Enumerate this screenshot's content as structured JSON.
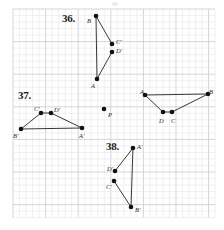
{
  "page": {
    "width": 224,
    "height": 230,
    "background": "#ffffff"
  },
  "grid": {
    "origin_x": 13,
    "origin_y": 9,
    "cell": 6.52,
    "cells_x": 31,
    "cells_y": 32,
    "minor_color": "#e3e3e6",
    "major_color": "#cdced2",
    "major_every": 5
  },
  "problems": [
    {
      "id": "36",
      "label": "36.",
      "x": 62,
      "y": 12
    },
    {
      "id": "37",
      "label": "37.",
      "x": 18,
      "y": 89
    },
    {
      "id": "38",
      "label": "38.",
      "x": 106,
      "y": 140
    }
  ],
  "figures": [
    {
      "name": "figure-36",
      "problem": "36",
      "points": [
        {
          "label": "B",
          "x": 96,
          "y": 16,
          "lx": 87,
          "ly": 18
        },
        {
          "label": "C'",
          "x": 112,
          "y": 44,
          "lx": 116,
          "ly": 39
        },
        {
          "label": "D'",
          "x": 112,
          "y": 52,
          "lx": 116,
          "ly": 48
        },
        {
          "label": "A",
          "x": 97,
          "y": 79,
          "lx": 91,
          "ly": 83
        }
      ],
      "segments": [
        {
          "from": "B",
          "to": "A"
        },
        {
          "from": "B",
          "to": "C'"
        },
        {
          "from": "D'",
          "to": "A"
        }
      ]
    },
    {
      "name": "figure-37",
      "problem": "37",
      "points": [
        {
          "label": "C'",
          "x": 41,
          "y": 113,
          "lx": 34,
          "ly": 106
        },
        {
          "label": "D'",
          "x": 51,
          "y": 113,
          "lx": 54,
          "ly": 107
        },
        {
          "label": "B'",
          "x": 21,
          "y": 129,
          "lx": 13,
          "ly": 133
        },
        {
          "label": "A'",
          "x": 82,
          "y": 128,
          "lx": 79,
          "ly": 133
        }
      ],
      "segments": [
        {
          "from": "C'",
          "to": "B'"
        },
        {
          "from": "D'",
          "to": "A'"
        },
        {
          "from": "B'",
          "to": "A'"
        },
        {
          "from": "C'",
          "to": "D'"
        }
      ]
    },
    {
      "name": "figure-original-abcd",
      "problem": "",
      "points": [
        {
          "label": "A",
          "x": 145,
          "y": 95,
          "lx": 140,
          "ly": 89
        },
        {
          "label": "B",
          "x": 208,
          "y": 94,
          "lx": 209,
          "ly": 89
        },
        {
          "label": "D",
          "x": 163,
          "y": 112,
          "lx": 159,
          "ly": 118
        },
        {
          "label": "C",
          "x": 172,
          "y": 112,
          "lx": 171,
          "ly": 118
        }
      ],
      "segments": [
        {
          "from": "A",
          "to": "B"
        },
        {
          "from": "A",
          "to": "D"
        },
        {
          "from": "D",
          "to": "C"
        },
        {
          "from": "C",
          "to": "B"
        }
      ]
    },
    {
      "name": "figure-38",
      "problem": "38",
      "points": [
        {
          "label": "A'",
          "x": 133,
          "y": 148,
          "lx": 137,
          "ly": 144
        },
        {
          "label": "D'",
          "x": 115,
          "y": 171,
          "lx": 107,
          "ly": 166
        },
        {
          "label": "C'",
          "x": 114,
          "y": 181,
          "lx": 106,
          "ly": 184
        },
        {
          "label": "B'",
          "x": 131,
          "y": 207,
          "lx": 135,
          "ly": 207
        }
      ],
      "segments": [
        {
          "from": "A'",
          "to": "D'"
        },
        {
          "from": "A'",
          "to": "B'"
        },
        {
          "from": "C'",
          "to": "B'"
        }
      ]
    }
  ],
  "center_point": {
    "name": "rotation-center-P",
    "label": "P",
    "x": 104,
    "y": 109,
    "lx": 108,
    "ly": 112
  },
  "style": {
    "point_color": "#111111",
    "point_radius": 2.3,
    "line_color": "#222222",
    "line_width": 0.9,
    "label_color": "#2a2a2a"
  },
  "artifacts": [
    {
      "name": "top-smudge",
      "x": 112,
      "y": 2,
      "w": 6,
      "h": 4
    }
  ]
}
